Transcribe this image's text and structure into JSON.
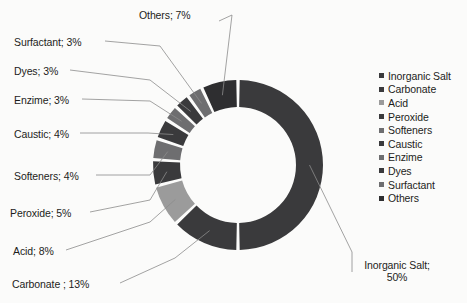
{
  "chart_data": {
    "type": "pie",
    "variant": "donut",
    "title": "",
    "xlabel": "",
    "ylabel": "",
    "start_angle_deg": 0,
    "direction": "clockwise",
    "inner_radius_ratio": 0.69,
    "categories": [
      "Inorganic Salt",
      "Carbonate",
      "Acid",
      "Peroxide",
      "Softeners",
      "Caustic",
      "Enzime",
      "Dyes",
      "Surfactant",
      "Others"
    ],
    "values": [
      50,
      13,
      8,
      5,
      4,
      4,
      3,
      3,
      3,
      7
    ],
    "unit": "%",
    "colors": [
      "#3a3a3c",
      "#3a3a3c",
      "#9b9b9b",
      "#3a3a3c",
      "#6e6e70",
      "#3a3a3c",
      "#6e6e70",
      "#3a3a3c",
      "#6e6e70",
      "#2e2e30"
    ],
    "legend_position": "right",
    "grid": false,
    "slices": [
      {
        "label": "Inorganic Salt",
        "value": 50,
        "color": "#3a3a3c"
      },
      {
        "label": "Carbonate",
        "value": 13,
        "color": "#3a3a3c"
      },
      {
        "label": "Acid",
        "value": 8,
        "color": "#9b9b9b"
      },
      {
        "label": "Peroxide",
        "value": 5,
        "color": "#3a3a3c"
      },
      {
        "label": "Softeners",
        "value": 4,
        "color": "#6e6e70"
      },
      {
        "label": "Caustic",
        "value": 4,
        "color": "#3a3a3c"
      },
      {
        "label": "Enzime",
        "value": 3,
        "color": "#6e6e70"
      },
      {
        "label": "Dyes",
        "value": 3,
        "color": "#3a3a3c"
      },
      {
        "label": "Surfactant",
        "value": 3,
        "color": "#6e6e70"
      },
      {
        "label": "Others",
        "value": 7,
        "color": "#2e2e30"
      }
    ]
  },
  "callouts": [
    {
      "name": "others",
      "text": "Others; 7%"
    },
    {
      "name": "surfactant",
      "text": "Surfactant; 3%"
    },
    {
      "name": "dyes",
      "text": "Dyes; 3%"
    },
    {
      "name": "enzime",
      "text": "Enzime; 3%"
    },
    {
      "name": "caustic",
      "text": "Caustic; 4%"
    },
    {
      "name": "softeners",
      "text": "Softeners; 4%"
    },
    {
      "name": "peroxide",
      "text": "Peroxide; 5%"
    },
    {
      "name": "acid",
      "text": "Acid; 8%"
    },
    {
      "name": "carbonate",
      "text": "Carbonate ; 13%"
    },
    {
      "name": "inorganic-salt",
      "text": "Inorganic Salt; 50%"
    }
  ],
  "legend": {
    "items": [
      {
        "label": "Inorganic Salt",
        "color": "#3a3a3c"
      },
      {
        "label": "Carbonate",
        "color": "#3a3a3c"
      },
      {
        "label": "Acid",
        "color": "#9b9b9b"
      },
      {
        "label": "Peroxide",
        "color": "#3a3a3c"
      },
      {
        "label": "Softeners",
        "color": "#6e6e70"
      },
      {
        "label": "Caustic",
        "color": "#3a3a3c"
      },
      {
        "label": "Enzime",
        "color": "#6e6e70"
      },
      {
        "label": "Dyes",
        "color": "#3a3a3c"
      },
      {
        "label": "Surfactant",
        "color": "#6e6e70"
      },
      {
        "label": "Others",
        "color": "#2e2e30"
      }
    ]
  },
  "style": {
    "background": "#fbfbfa",
    "text_color": "#1d1d1b",
    "leader_color": "#8c8c8c",
    "slice_gap_color": "#fbfbfa"
  },
  "geometry": {
    "center_x": 238,
    "center_y": 165,
    "outer_radius": 85,
    "inner_radius": 58
  }
}
